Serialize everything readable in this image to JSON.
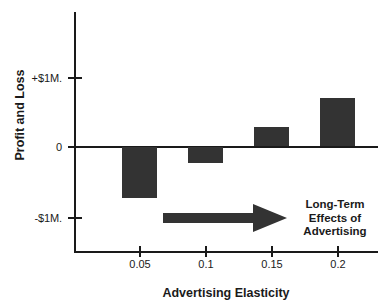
{
  "chart_data": {
    "type": "bar",
    "title": "",
    "xlabel": "Advertising Elasticity",
    "ylabel": "Profit and Loss",
    "categories": [
      "0.05",
      "0.1",
      "0.15",
      "0.2"
    ],
    "values": [
      -0.73,
      -0.23,
      0.27,
      0.69
    ],
    "value_units": "millions of dollars",
    "ylim": [
      -1.5,
      1.95
    ],
    "yticks": [
      "-$1M.",
      "0",
      "+$1M."
    ],
    "ytick_values": [
      -1,
      0,
      1
    ],
    "xticks": [
      "0.05",
      "0.1",
      "0.15",
      "0.2"
    ],
    "xtick_values": [
      0.05,
      0.1,
      0.15,
      0.2
    ],
    "grid": false,
    "legend": false,
    "bar_color": "#333333",
    "axis_color": "#1a1a1a",
    "annotations": [
      {
        "name": "long-term-effects-arrow",
        "kind": "arrow",
        "direction": "right",
        "from_x": 0.065,
        "to_x": 0.165,
        "y": -1.0
      },
      {
        "name": "long-term-effects-label",
        "kind": "text",
        "lines": [
          "Long-Term",
          "Effects of",
          "Advertising"
        ]
      }
    ]
  },
  "axes": {
    "y_title": "Profit and Loss",
    "x_title": "Advertising Elasticity",
    "y_tick_labels": [
      {
        "label": "+$1M.",
        "top": 72
      },
      {
        "label": "0",
        "top": 141
      },
      {
        "label": "-$1M.",
        "top": 212
      }
    ],
    "y_ticks_top": [
      77,
      146,
      217
    ],
    "x_ticks_left": [
      139,
      205,
      271,
      337
    ],
    "x_tick_labels": [
      {
        "label": "0.05",
        "left": 140
      },
      {
        "label": "0.1",
        "left": 206
      },
      {
        "label": "0.15",
        "left": 272
      },
      {
        "label": "0.2",
        "left": 338
      }
    ]
  },
  "bars": [
    {
      "name": "bar-0.05",
      "category": "0.05",
      "value": -0.73,
      "left": 122,
      "top": 147,
      "width": 35,
      "height": 51
    },
    {
      "name": "bar-0.1",
      "category": "0.1",
      "value": -0.23,
      "left": 188,
      "top": 147,
      "width": 35,
      "height": 16
    },
    {
      "name": "bar-0.15",
      "category": "0.15",
      "value": 0.27,
      "left": 254,
      "top": 127,
      "width": 35,
      "height": 19
    },
    {
      "name": "bar-0.2",
      "category": "0.2",
      "value": 0.69,
      "left": 320,
      "top": 98,
      "width": 35,
      "height": 48
    }
  ],
  "annotation": {
    "line1": "Long-Term",
    "line2": "Effects of",
    "line3": "Advertising"
  }
}
